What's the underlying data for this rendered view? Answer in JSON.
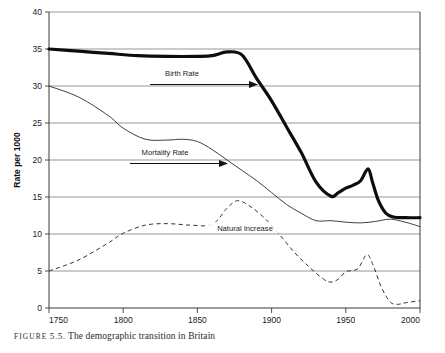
{
  "caption": {
    "label": "FIGURE",
    "number": "5.5.",
    "text": "The demographic transition in Britain"
  },
  "chart_data": {
    "type": "line",
    "title": "",
    "xlabel": "",
    "ylabel": "Rate per 1000",
    "xlim": [
      1750,
      2000
    ],
    "ylim": [
      0,
      40
    ],
    "xticks": [
      "1750",
      "1800",
      "1850",
      "1900",
      "1950",
      "2000"
    ],
    "yticks": [
      "0",
      "5",
      "10",
      "15",
      "20",
      "25",
      "30",
      "35",
      "40"
    ],
    "grid": true,
    "legend_position": "inline-annotations",
    "annotations": [
      {
        "name": "Birth Rate",
        "arrow": true
      },
      {
        "name": "Mortality Rate",
        "arrow": true
      },
      {
        "name": "Natural Increase",
        "arrow": false
      }
    ],
    "series": [
      {
        "name": "Birth Rate",
        "style": "thick-solid",
        "x": [
          1750,
          1770,
          1790,
          1810,
          1830,
          1850,
          1860,
          1870,
          1880,
          1890,
          1900,
          1910,
          1920,
          1930,
          1940,
          1945,
          1950,
          1955,
          1960,
          1965,
          1968,
          1972,
          1977,
          1982,
          1990,
          2000
        ],
        "y": [
          35.0,
          34.7,
          34.4,
          34.1,
          34.0,
          34.0,
          34.1,
          34.6,
          34.2,
          31.0,
          28.0,
          24.5,
          21.0,
          17.0,
          15.1,
          15.6,
          16.2,
          16.6,
          17.2,
          18.8,
          17.0,
          14.5,
          12.8,
          12.3,
          12.2,
          12.2
        ]
      },
      {
        "name": "Mortality Rate",
        "style": "thin-solid",
        "x": [
          1750,
          1770,
          1790,
          1800,
          1815,
          1830,
          1840,
          1850,
          1860,
          1870,
          1880,
          1890,
          1900,
          1910,
          1920,
          1930,
          1940,
          1950,
          1960,
          1970,
          1980,
          1990,
          2000
        ],
        "y": [
          30.0,
          28.5,
          26.0,
          24.3,
          22.8,
          22.7,
          22.8,
          22.5,
          21.4,
          20.0,
          18.6,
          17.2,
          15.6,
          14.0,
          12.8,
          11.8,
          11.8,
          11.6,
          11.5,
          11.7,
          12.0,
          11.6,
          11.0
        ]
      },
      {
        "name": "Natural Increase",
        "style": "dashed",
        "x": [
          1750,
          1770,
          1790,
          1800,
          1815,
          1830,
          1845,
          1860,
          1870,
          1877,
          1885,
          1895,
          1905,
          1915,
          1925,
          1935,
          1940,
          1945,
          1950,
          1958,
          1964,
          1968,
          1974,
          1980,
          1985,
          1990,
          2000
        ],
        "y": [
          5.0,
          6.5,
          8.8,
          10.1,
          11.2,
          11.4,
          11.2,
          11.3,
          13.5,
          14.5,
          13.8,
          12.2,
          10.0,
          7.6,
          5.6,
          3.9,
          3.5,
          3.9,
          4.9,
          5.3,
          7.2,
          6.0,
          2.8,
          0.8,
          0.5,
          0.7,
          1.0
        ]
      }
    ]
  }
}
